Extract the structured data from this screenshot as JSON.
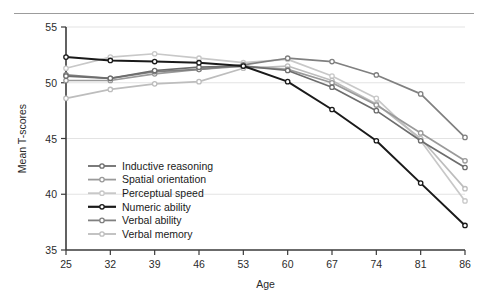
{
  "figure": {
    "has_top_rule": true,
    "background": "#ffffff"
  },
  "chart_data": {
    "type": "line",
    "title": "",
    "xlabel": "Age",
    "ylabel": "Mean T-scores",
    "categories": [
      25,
      32,
      39,
      46,
      53,
      60,
      67,
      74,
      81,
      86
    ],
    "x_tick_labels": [
      "25",
      "32",
      "39",
      "46",
      "53",
      "60",
      "67",
      "74",
      "81",
      "86"
    ],
    "y_tick_labels": [
      "35",
      "40",
      "45",
      "50",
      "55"
    ],
    "y_ticks": [
      35,
      40,
      45,
      50,
      55
    ],
    "ylim": [
      35,
      55
    ],
    "grid": "horizontal",
    "legend_position": "inside-lower-left",
    "marker": "circle-outline",
    "series": [
      {
        "name": "Inductive reasoning",
        "color": "#6d6d6d",
        "values": [
          50.6,
          50.4,
          51.1,
          51.4,
          51.5,
          51.1,
          49.6,
          47.5,
          44.8,
          42.4
        ]
      },
      {
        "name": "Spatial orientation",
        "color": "#9a9a9a",
        "values": [
          50.2,
          50.2,
          50.8,
          51.2,
          51.5,
          51.2,
          50.0,
          48.0,
          45.5,
          43.0
        ]
      },
      {
        "name": "Perceptual speed",
        "color": "#c8c8c8",
        "values": [
          51.3,
          52.3,
          52.6,
          52.2,
          51.8,
          52.1,
          50.6,
          48.6,
          44.8,
          39.4
        ]
      },
      {
        "name": "Numeric ability",
        "color": "#1a1a1a",
        "values": [
          52.3,
          52.0,
          51.9,
          51.8,
          51.5,
          50.1,
          47.6,
          44.8,
          41.0,
          37.2
        ]
      },
      {
        "name": "Verbal ability",
        "color": "#808080",
        "values": [
          50.7,
          50.4,
          51.0,
          51.2,
          51.6,
          52.2,
          51.9,
          50.7,
          49.0,
          45.1
        ]
      },
      {
        "name": "Verbal memory",
        "color": "#bdbdbd",
        "values": [
          48.6,
          49.4,
          49.9,
          50.1,
          51.3,
          51.5,
          50.2,
          48.1,
          45.0,
          40.5
        ]
      }
    ]
  },
  "axes": {
    "x_axis_label": "Age",
    "y_axis_label": "Mean T-scores"
  }
}
